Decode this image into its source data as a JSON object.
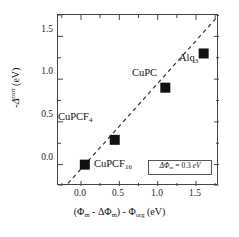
{
  "chart_data": {
    "type": "scatter",
    "title": "",
    "xlabel": "(Φm - ΔΦm) - Φorg (eV)",
    "ylabel": "-Δcorr (eV)",
    "xlim": [
      -0.3,
      1.8
    ],
    "ylim": [
      -0.25,
      1.75
    ],
    "grid": false,
    "legend_position": "lower-right",
    "xticks": [
      {
        "value": 0.0,
        "label": "0.0"
      },
      {
        "value": 0.5,
        "label": "0.5"
      },
      {
        "value": 1.0,
        "label": "1.0"
      },
      {
        "value": 1.5,
        "label": "1.5"
      }
    ],
    "xticks_minor": [
      -0.25,
      0.25,
      0.75,
      1.25,
      1.75
    ],
    "yticks": [
      {
        "value": 0.0,
        "label": "0.0"
      },
      {
        "value": 0.5,
        "label": "0.5"
      },
      {
        "value": 1.0,
        "label": "1.0"
      },
      {
        "value": 1.5,
        "label": "1.5"
      }
    ],
    "yticks_minor": [
      -0.25,
      0.25,
      0.75,
      1.25,
      1.75
    ],
    "points": [
      {
        "label": "CuPCF16",
        "x": 0.05,
        "y": 0.0
      },
      {
        "label": "CuPCF4",
        "x": 0.44,
        "y": 0.29
      },
      {
        "label": "CuPC",
        "x": 1.1,
        "y": 0.9
      },
      {
        "label": "Alq3",
        "x": 1.6,
        "y": 1.3
      }
    ],
    "marker": {
      "shape": "square",
      "color": "#111111",
      "size_px": 10
    },
    "fit_line": {
      "style": "dashed",
      "color": "#333333",
      "slope": 1.0,
      "intercept": -0.05,
      "x_start": -0.3,
      "x_end": 1.8
    },
    "annotations": [
      {
        "name": "cupcf16-label",
        "text_main": "CuPCF",
        "text_sub": "16",
        "x_px": 93,
        "y_px": 157
      },
      {
        "name": "cupcf4-label",
        "text_main": "CuPCF",
        "text_sub": "4",
        "x_px": 57,
        "y_px": 110
      },
      {
        "name": "cupc-label",
        "text_main": "CuPC",
        "text_sub": "",
        "x_px": 131,
        "y_px": 66
      },
      {
        "name": "alq3-label",
        "text_main": "Alq",
        "text_sub": "3",
        "x_px": 178,
        "y_px": 51
      }
    ],
    "legend": {
      "prefix": "ΔΦ",
      "subscript": "m",
      "equals": " = 0.3 ",
      "unit": "eV"
    }
  },
  "axis_titles": {
    "y_minus": "-",
    "y_delta": "Δ",
    "y_sup": "corr",
    "y_units": " (eV)",
    "x_open": "(",
    "x_phi1": "Φ",
    "x_sub1": "m",
    "x_minus1": " - ",
    "x_delta": "ΔΦ",
    "x_sub2": "m",
    "x_close": ")",
    "x_minus2": " - ",
    "x_phi2": "Φ",
    "x_sub3": "org",
    "x_units": " (eV)"
  }
}
